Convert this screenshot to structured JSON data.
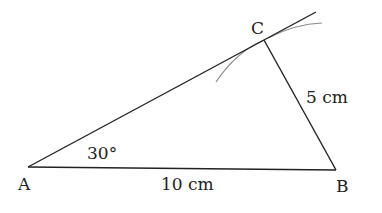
{
  "diagram": {
    "type": "triangle-construction",
    "vertices": {
      "A": {
        "label": "A",
        "x": 28,
        "y": 167
      },
      "B": {
        "label": "B",
        "x": 336,
        "y": 170
      },
      "C": {
        "label": "C",
        "x": 264,
        "y": 40
      }
    },
    "labels": {
      "A": "A",
      "B": "B",
      "C": "C",
      "angle_A": "30°",
      "side_AB": "10 cm",
      "side_BC": "5 cm"
    },
    "ray_end": {
      "x": 316,
      "y": 12
    },
    "colors": {
      "line": "#222222",
      "arc": "#888888"
    }
  }
}
